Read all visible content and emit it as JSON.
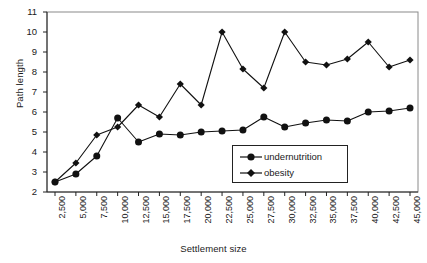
{
  "chart_data": {
    "type": "line",
    "title": "",
    "xlabel": "Settlement size",
    "ylabel": "Path length",
    "ylim": [
      2,
      11
    ],
    "yticks": [
      2,
      3,
      4,
      5,
      6,
      7,
      8,
      9,
      10,
      11
    ],
    "grid": false,
    "legend_position": "inside-bottom-right",
    "categories": [
      "2,500",
      "5,000",
      "7,500",
      "10,000",
      "12,500",
      "15,000",
      "17,500",
      "20,000",
      "22,500",
      "25,000",
      "27,500",
      "30,000",
      "32,500",
      "35,000",
      "37,500",
      "40,000",
      "42,500",
      "45,000"
    ],
    "series": [
      {
        "name": "undernutrition",
        "marker": "circle",
        "values": [
          2.5,
          2.9,
          3.8,
          5.7,
          4.5,
          4.9,
          4.85,
          5.0,
          5.05,
          5.1,
          5.75,
          5.25,
          5.45,
          5.6,
          5.55,
          6.0,
          6.05,
          6.2
        ]
      },
      {
        "name": "obesity",
        "marker": "diamond",
        "values": [
          2.5,
          3.45,
          4.85,
          5.25,
          6.35,
          5.75,
          7.4,
          6.35,
          10.0,
          8.15,
          7.2,
          10.0,
          8.5,
          8.35,
          8.65,
          9.5,
          8.25,
          8.6
        ]
      }
    ]
  },
  "legend": {
    "items": [
      {
        "label": "undernutrition",
        "marker": "circle"
      },
      {
        "label": "obesity",
        "marker": "diamond"
      }
    ]
  }
}
